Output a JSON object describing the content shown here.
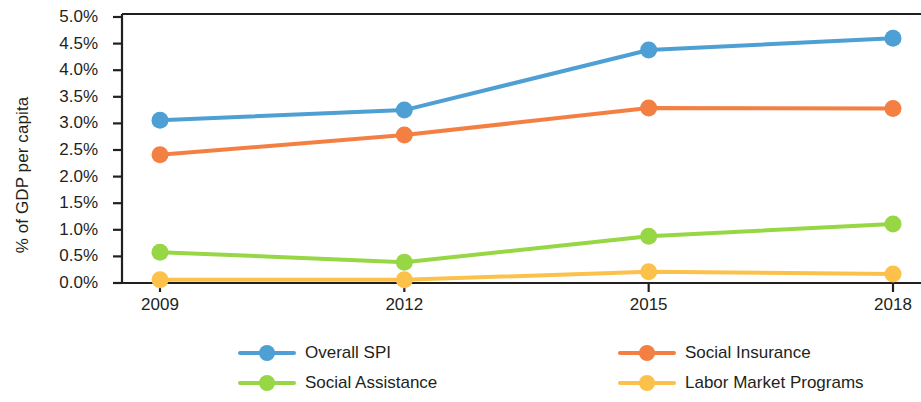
{
  "chart_data": {
    "type": "line",
    "title": "",
    "subtitle": "",
    "xlabel": "",
    "ylabel": "% of GDP per capita",
    "x": [
      2009,
      2012,
      2015,
      2018
    ],
    "categories": [
      "2009",
      "2012",
      "2015",
      "2018"
    ],
    "xtick_labels": [
      "2009",
      "2012",
      "2015",
      "2018"
    ],
    "ytick_labels": [
      "0.0%",
      "0.5%",
      "1.0%",
      "1.5%",
      "2.0%",
      "2.5%",
      "3.0%",
      "3.5%",
      "4.0%",
      "4.5%",
      "5.0%"
    ],
    "ytick_values": [
      0.0,
      0.5,
      1.0,
      1.5,
      2.0,
      2.5,
      3.0,
      3.5,
      4.0,
      4.5,
      5.0
    ],
    "ylim": [
      0.0,
      5.0
    ],
    "xlim": [
      2009,
      2018
    ],
    "grid": false,
    "legend_position": "bottom",
    "series": [
      {
        "name": "Overall SPI",
        "color": "#4e9fd4",
        "values": [
          3.06,
          3.25,
          4.38,
          4.6
        ]
      },
      {
        "name": "Social Insurance",
        "color": "#f37f42",
        "values": [
          2.41,
          2.78,
          3.29,
          3.28
        ]
      },
      {
        "name": "Social Assistance",
        "color": "#97d644",
        "values": [
          0.58,
          0.39,
          0.88,
          1.11
        ]
      },
      {
        "name": "Labor Market Programs",
        "color": "#fbc14a",
        "values": [
          0.06,
          0.06,
          0.21,
          0.17
        ]
      }
    ]
  },
  "legend": {
    "items": [
      {
        "label": "Overall SPI",
        "color": "#4e9fd4"
      },
      {
        "label": "Social Insurance",
        "color": "#f37f42"
      },
      {
        "label": "Social Assistance",
        "color": "#97d644"
      },
      {
        "label": "Labor Market Programs",
        "color": "#fbc14a"
      }
    ]
  },
  "axes": {
    "y_title": "% of GDP per capita",
    "axis_color": "#231f20"
  }
}
